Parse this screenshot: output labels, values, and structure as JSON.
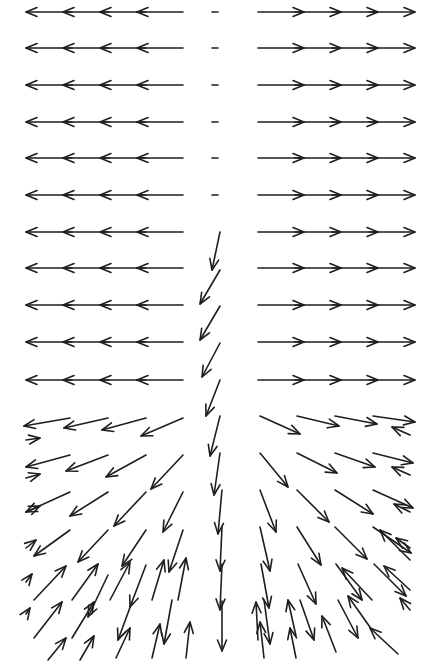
{
  "chart_data": {
    "type": "quiver",
    "title": "",
    "xlabel": "",
    "ylabel": "",
    "grid": false,
    "legend": null,
    "color": "#1e1e1e",
    "rows_y": [
      12,
      48,
      85,
      122,
      158,
      195,
      232,
      268,
      305,
      342,
      380,
      418,
      455,
      492,
      530,
      568,
      605,
      642
    ],
    "upper_rows": 11,
    "left_cols_x": [
      26,
      63,
      100,
      137
    ],
    "left_len": 46,
    "right_cols_x": [
      258,
      295,
      332,
      369
    ],
    "right_len": 46,
    "center_x": 215,
    "arrows_lower": [
      {
        "x": 70,
        "y": 418,
        "dx": -46,
        "dy": 8
      },
      {
        "x": 108,
        "y": 418,
        "dx": -44,
        "dy": 10
      },
      {
        "x": 146,
        "y": 418,
        "dx": -44,
        "dy": 12
      },
      {
        "x": 183,
        "y": 418,
        "dx": -42,
        "dy": 18
      },
      {
        "x": 70,
        "y": 455,
        "dx": -44,
        "dy": 12
      },
      {
        "x": 108,
        "y": 455,
        "dx": -42,
        "dy": 16
      },
      {
        "x": 146,
        "y": 455,
        "dx": -40,
        "dy": 22
      },
      {
        "x": 183,
        "y": 455,
        "dx": -32,
        "dy": 34
      },
      {
        "x": 70,
        "y": 492,
        "dx": -44,
        "dy": 20
      },
      {
        "x": 108,
        "y": 492,
        "dx": -38,
        "dy": 24
      },
      {
        "x": 146,
        "y": 492,
        "dx": -32,
        "dy": 34
      },
      {
        "x": 183,
        "y": 492,
        "dx": -20,
        "dy": 40
      },
      {
        "x": 70,
        "y": 530,
        "dx": -36,
        "dy": 26
      },
      {
        "x": 108,
        "y": 530,
        "dx": -30,
        "dy": 32
      },
      {
        "x": 146,
        "y": 530,
        "dx": -24,
        "dy": 36
      },
      {
        "x": 183,
        "y": 530,
        "dx": -14,
        "dy": 42
      },
      {
        "x": 34,
        "y": 600,
        "dx": 32,
        "dy": -34
      },
      {
        "x": 72,
        "y": 600,
        "dx": 26,
        "dy": -36
      },
      {
        "x": 110,
        "y": 600,
        "dx": 20,
        "dy": -38
      },
      {
        "x": 152,
        "y": 600,
        "dx": 12,
        "dy": -40
      },
      {
        "x": 178,
        "y": 600,
        "dx": 8,
        "dy": -42
      },
      {
        "x": 34,
        "y": 638,
        "dx": 28,
        "dy": -36
      },
      {
        "x": 72,
        "y": 638,
        "dx": 22,
        "dy": -36
      },
      {
        "x": 116,
        "y": 658,
        "dx": 14,
        "dy": -30
      },
      {
        "x": 152,
        "y": 658,
        "dx": 8,
        "dy": -34
      },
      {
        "x": 186,
        "y": 658,
        "dx": 4,
        "dy": -36
      },
      {
        "x": 48,
        "y": 660,
        "dx": 18,
        "dy": -22
      },
      {
        "x": 80,
        "y": 660,
        "dx": 14,
        "dy": -24
      },
      {
        "x": 108,
        "y": 575,
        "dx": -20,
        "dy": 42
      },
      {
        "x": 146,
        "y": 565,
        "dx": -16,
        "dy": 42
      },
      {
        "x": 172,
        "y": 600,
        "dx": -8,
        "dy": 44
      },
      {
        "x": 132,
        "y": 602,
        "dx": -14,
        "dy": 38
      },
      {
        "x": 220,
        "y": 232,
        "dx": -8,
        "dy": 38
      },
      {
        "x": 220,
        "y": 270,
        "dx": -20,
        "dy": 34
      },
      {
        "x": 220,
        "y": 306,
        "dx": -20,
        "dy": 34
      },
      {
        "x": 220,
        "y": 343,
        "dx": -18,
        "dy": 34
      },
      {
        "x": 220,
        "y": 380,
        "dx": -14,
        "dy": 36
      },
      {
        "x": 220,
        "y": 416,
        "dx": -10,
        "dy": 40
      },
      {
        "x": 220,
        "y": 453,
        "dx": -6,
        "dy": 42
      },
      {
        "x": 222,
        "y": 490,
        "dx": -4,
        "dy": 44
      },
      {
        "x": 222,
        "y": 527,
        "dx": -2,
        "dy": 44
      },
      {
        "x": 222,
        "y": 564,
        "dx": -2,
        "dy": 46
      },
      {
        "x": 222,
        "y": 601,
        "dx": 0,
        "dy": 50
      },
      {
        "x": 260,
        "y": 416,
        "dx": 40,
        "dy": 18
      },
      {
        "x": 297,
        "y": 416,
        "dx": 42,
        "dy": 10
      },
      {
        "x": 335,
        "y": 416,
        "dx": 42,
        "dy": 8
      },
      {
        "x": 373,
        "y": 416,
        "dx": 42,
        "dy": 6
      },
      {
        "x": 260,
        "y": 453,
        "dx": 28,
        "dy": 34
      },
      {
        "x": 297,
        "y": 453,
        "dx": 40,
        "dy": 20
      },
      {
        "x": 335,
        "y": 453,
        "dx": 40,
        "dy": 14
      },
      {
        "x": 373,
        "y": 453,
        "dx": 40,
        "dy": 10
      },
      {
        "x": 260,
        "y": 490,
        "dx": 16,
        "dy": 42
      },
      {
        "x": 297,
        "y": 490,
        "dx": 32,
        "dy": 32
      },
      {
        "x": 335,
        "y": 490,
        "dx": 38,
        "dy": 24
      },
      {
        "x": 373,
        "y": 490,
        "dx": 40,
        "dy": 18
      },
      {
        "x": 260,
        "y": 527,
        "dx": 10,
        "dy": 44
      },
      {
        "x": 297,
        "y": 527,
        "dx": 24,
        "dy": 38
      },
      {
        "x": 335,
        "y": 527,
        "dx": 32,
        "dy": 32
      },
      {
        "x": 373,
        "y": 527,
        "dx": 38,
        "dy": 26
      },
      {
        "x": 261,
        "y": 564,
        "dx": 8,
        "dy": 44
      },
      {
        "x": 298,
        "y": 564,
        "dx": 18,
        "dy": 40
      },
      {
        "x": 336,
        "y": 564,
        "dx": 26,
        "dy": 36
      },
      {
        "x": 374,
        "y": 564,
        "dx": 32,
        "dy": 32
      },
      {
        "x": 264,
        "y": 600,
        "dx": 6,
        "dy": 44
      },
      {
        "x": 300,
        "y": 600,
        "dx": 14,
        "dy": 40
      },
      {
        "x": 338,
        "y": 600,
        "dx": 20,
        "dy": 38
      },
      {
        "x": 258,
        "y": 640,
        "dx": -2,
        "dy": -38
      },
      {
        "x": 264,
        "y": 658,
        "dx": -4,
        "dy": -36
      },
      {
        "x": 296,
        "y": 636,
        "dx": -8,
        "dy": -36
      },
      {
        "x": 296,
        "y": 658,
        "dx": -6,
        "dy": -30
      },
      {
        "x": 336,
        "y": 652,
        "dx": -14,
        "dy": -36
      },
      {
        "x": 372,
        "y": 630,
        "dx": -24,
        "dy": -34
      },
      {
        "x": 372,
        "y": 600,
        "dx": -30,
        "dy": -32
      },
      {
        "x": 410,
        "y": 590,
        "dx": -26,
        "dy": -24
      },
      {
        "x": 398,
        "y": 654,
        "dx": -28,
        "dy": -26
      },
      {
        "x": 410,
        "y": 560,
        "dx": -30,
        "dy": -30
      },
      {
        "x": 410,
        "y": 435,
        "dx": -18,
        "dy": -8
      },
      {
        "x": 410,
        "y": 475,
        "dx": -18,
        "dy": -8
      },
      {
        "x": 410,
        "y": 512,
        "dx": -16,
        "dy": -8
      },
      {
        "x": 410,
        "y": 548,
        "dx": -14,
        "dy": -10
      },
      {
        "x": 410,
        "y": 610,
        "dx": -10,
        "dy": -12
      },
      {
        "x": 26,
        "y": 440,
        "dx": 14,
        "dy": -2
      },
      {
        "x": 26,
        "y": 478,
        "dx": 14,
        "dy": -4
      },
      {
        "x": 26,
        "y": 512,
        "dx": 14,
        "dy": -6
      },
      {
        "x": 26,
        "y": 548,
        "dx": 10,
        "dy": -8
      },
      {
        "x": 26,
        "y": 582,
        "dx": 6,
        "dy": -8
      },
      {
        "x": 26,
        "y": 614,
        "dx": 4,
        "dy": -6
      }
    ]
  }
}
